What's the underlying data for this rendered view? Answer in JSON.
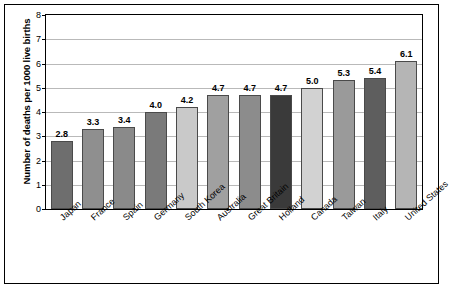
{
  "chart_data": {
    "type": "bar",
    "title": "",
    "xlabel": "",
    "ylabel": "Number of deaths per 1000 live births",
    "ylim": [
      0,
      8
    ],
    "yticks": [
      0,
      1,
      2,
      3,
      4,
      5,
      6,
      7,
      8
    ],
    "ytick_labels": [
      "0",
      "1",
      "2",
      "3",
      "4",
      "5",
      "6",
      "7",
      "8"
    ],
    "grid": true,
    "legend": "none",
    "categories": [
      "Japan",
      "France",
      "Spain",
      "Germany",
      "South Korea",
      "Australia",
      "Great Britain",
      "Holland",
      "Canada",
      "Taiwan",
      "Italy",
      "United States"
    ],
    "values": [
      2.8,
      3.3,
      3.4,
      4.0,
      4.2,
      4.7,
      4.7,
      4.7,
      5.0,
      5.3,
      5.4,
      6.1
    ],
    "value_labels": [
      "2.8",
      "3.3",
      "3.4",
      "4.0",
      "4.2",
      "4.7",
      "4.7",
      "4.7",
      "5.0",
      "5.3",
      "5.4",
      "6.1"
    ],
    "bar_colors": [
      "#6e6e6e",
      "#8f8f8f",
      "#8a8a8a",
      "#7a7a7a",
      "#c9c9c9",
      "#a0a0a0",
      "#8c8c8c",
      "#3a3a3a",
      "#d2d2d2",
      "#9a9a9a",
      "#5e5e5e",
      "#b5b5b5"
    ]
  }
}
